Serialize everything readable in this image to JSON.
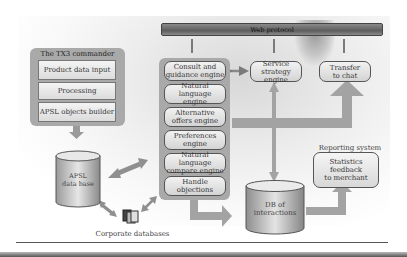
{
  "web_protocol": {
    "label": "Web protocol"
  },
  "commander": {
    "title": "The TX3 commander",
    "items": [
      {
        "label": "Product data input"
      },
      {
        "label": "Processing"
      },
      {
        "label": "APSL objects builder"
      }
    ]
  },
  "engines": {
    "items": [
      {
        "line1": "Consult and",
        "line2": "guidance engine"
      },
      {
        "line1": "Natural language",
        "line2": "engine"
      },
      {
        "line1": "Alternative",
        "line2": "offers engine"
      },
      {
        "line1": "Preferences",
        "line2": "engine"
      },
      {
        "line1": "Natural language",
        "line2": "compare engine"
      },
      {
        "line1": "Handle",
        "line2": "objections"
      }
    ]
  },
  "service_strategy": {
    "line1": "Service strategy",
    "line2": "engine"
  },
  "transfer_chat": {
    "line1": "Transfer",
    "line2": "to chat"
  },
  "apsl_db": {
    "line1": "APSL",
    "line2": "data base"
  },
  "corporate_db": {
    "label": "Corporate databases"
  },
  "interactions_db": {
    "line1": "DB of",
    "line2": "interactions"
  },
  "reporting": {
    "title": "Reporting system",
    "line1": "Statistics",
    "line2": "feedback",
    "line3": "to merchant"
  },
  "colors": {
    "panel": "#a9a9a9",
    "arrow": "#a3a3a3",
    "box_border": "#555555",
    "web_bar": "#6e6e6e"
  }
}
